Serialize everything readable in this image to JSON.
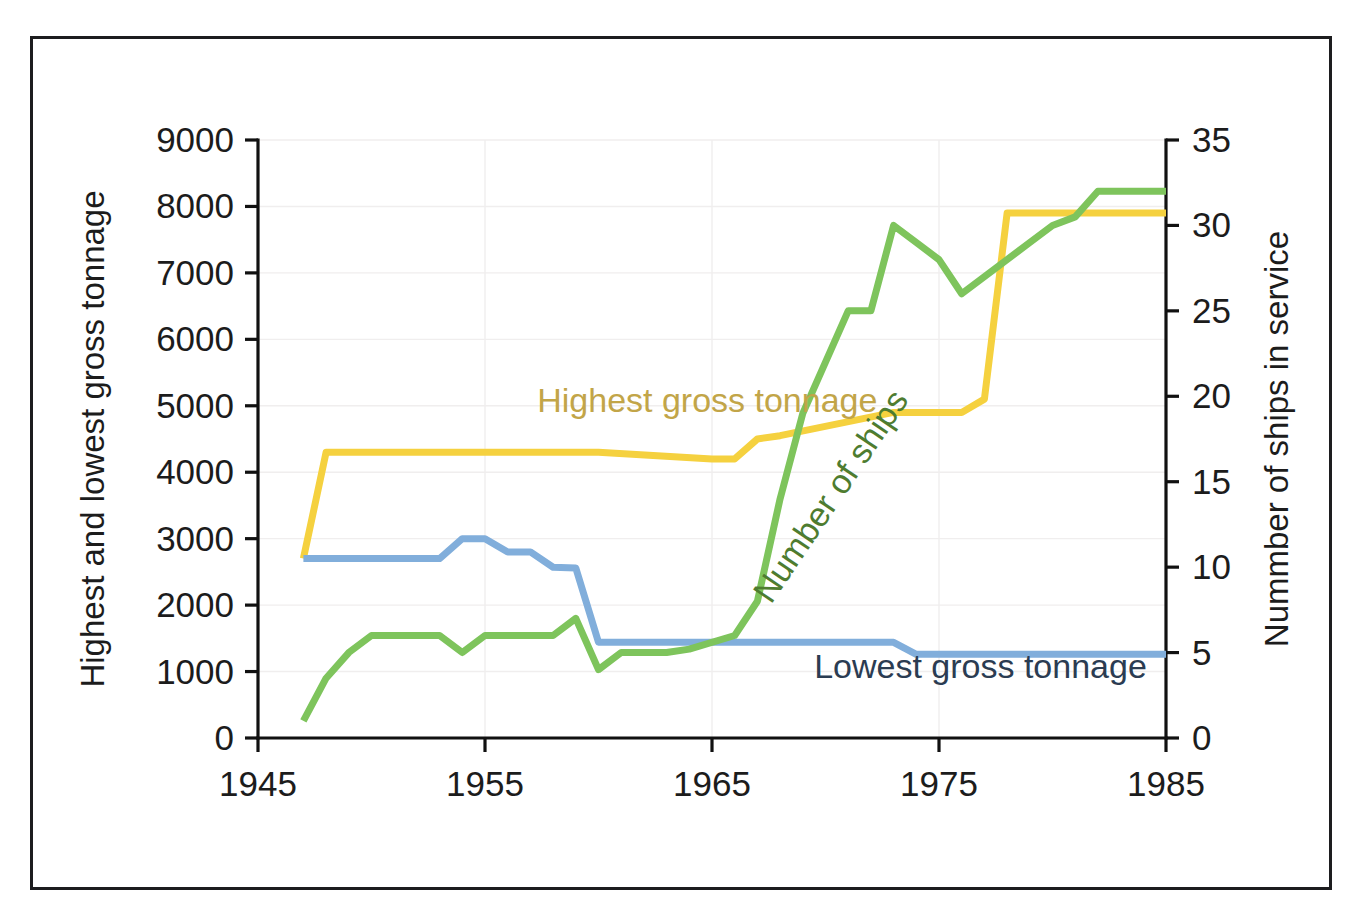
{
  "chart_data": {
    "type": "line",
    "title": "",
    "xlabel": "",
    "ylabel": "Highest and lowest gross tonnage",
    "y2label": "Nummber of ships in service",
    "xlim": [
      1945,
      1985
    ],
    "ylim": [
      0,
      9000
    ],
    "y2lim": [
      0,
      35
    ],
    "grid": true,
    "legend_position": "inline-annotations",
    "xticks": [
      1945,
      1955,
      1965,
      1975,
      1985
    ],
    "xtick_labels": [
      "1945",
      "1955",
      "1965",
      "1975",
      "1985"
    ],
    "yticks": [
      0,
      1000,
      2000,
      3000,
      4000,
      5000,
      6000,
      7000,
      8000,
      9000
    ],
    "ytick_labels": [
      "0",
      "1000",
      "2000",
      "3000",
      "4000",
      "5000",
      "6000",
      "7000",
      "8000",
      "9000"
    ],
    "y2ticks": [
      0,
      5,
      10,
      15,
      20,
      25,
      30,
      35
    ],
    "y2tick_labels": [
      "0",
      "5",
      "10",
      "15",
      "20",
      "25",
      "30",
      "35"
    ],
    "series": [
      {
        "name": "Highest gross tonnage",
        "axis": "left",
        "color": "#f5d13f",
        "label_color": "#c2a548",
        "x": [
          1947,
          1948,
          1959,
          1960,
          1965,
          1966,
          1967,
          1968,
          1973,
          1974,
          1976,
          1977,
          1978,
          1985
        ],
        "values": [
          2700,
          4300,
          4300,
          4300,
          4200,
          4200,
          4500,
          4550,
          4900,
          4900,
          4900,
          5100,
          7900,
          7900
        ]
      },
      {
        "name": "Lowest gross tonnage",
        "axis": "left",
        "color": "#81aedb",
        "label_color": "#2b3c52",
        "x": [
          1947,
          1953,
          1954,
          1955,
          1956,
          1957,
          1958,
          1959,
          1960,
          1961,
          1973,
          1974,
          1985
        ],
        "values": [
          2700,
          2700,
          3000,
          3000,
          2800,
          2800,
          2570,
          2560,
          1440,
          1440,
          1440,
          1260,
          1260
        ]
      },
      {
        "name": "Number of ships",
        "axis": "right",
        "color": "#7ec45c",
        "label_color": "#4e7c30",
        "x": [
          1947,
          1948,
          1949,
          1950,
          1953,
          1954,
          1955,
          1958,
          1959,
          1960,
          1961,
          1962,
          1963,
          1964,
          1966,
          1967,
          1968,
          1969,
          1970,
          1971,
          1972,
          1973,
          1974,
          1975,
          1976,
          1979,
          1980,
          1981,
          1982,
          1985
        ],
        "values": [
          1,
          3.5,
          5,
          6,
          6,
          5,
          6,
          6,
          7,
          4,
          5,
          5,
          5,
          5.2,
          6,
          8,
          14,
          19,
          22,
          25,
          25,
          30,
          29,
          28,
          26,
          29,
          30,
          30.5,
          32,
          32
        ]
      }
    ],
    "annotations": [
      {
        "name": "highest-gross-tonnage-label",
        "text": "Highest gross tonnage",
        "x": 1957.3,
        "y": 4900,
        "axis": "left",
        "rotate": 0,
        "color": "#c2a548"
      },
      {
        "name": "lowest-gross-tonnage-label",
        "text": "Lowest gross tonnage",
        "x": 1969.5,
        "y": 900,
        "axis": "left",
        "rotate": 0,
        "color": "#2b3c52"
      },
      {
        "name": "number-of-ships-label",
        "text": "Number of  ships",
        "x": 1967.6,
        "y": 2000,
        "axis": "left",
        "rotate": -56,
        "color": "#4e7c30"
      }
    ]
  },
  "geometry": {
    "plot_left": 258,
    "plot_right": 1166,
    "plot_top": 140,
    "plot_bottom": 738
  }
}
